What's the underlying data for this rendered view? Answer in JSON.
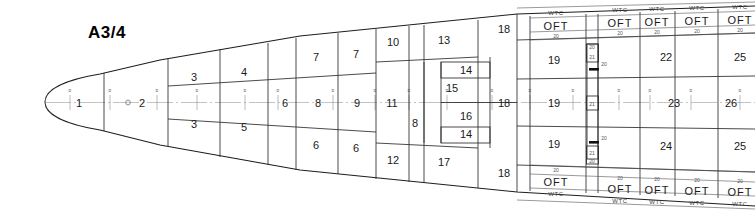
{
  "drawing": {
    "title": "A3/4",
    "type": "ship-general-arrangement-tank-plan",
    "view": "plan-view-deck-layout",
    "canvas": {
      "width": 755,
      "height": 213
    },
    "background_color": "#ffffff",
    "line_color": "#1d1d1d",
    "centerline_color": "#9a9a9a"
  },
  "labels": {
    "oft": "OFT",
    "wtc": "WTC",
    "dim_20": "20",
    "dim_21": "21"
  },
  "centerline_compartments": [
    {
      "id": "cl-1",
      "label": "1",
      "x": 73,
      "y": 102
    },
    {
      "id": "cl-2",
      "label": "2",
      "x": 140,
      "y": 102
    },
    {
      "id": "cl-6",
      "label": "6",
      "x": 285,
      "y": 102
    },
    {
      "id": "cl-8",
      "label": "8",
      "x": 318,
      "y": 102
    },
    {
      "id": "cl-9",
      "label": "9",
      "x": 360,
      "y": 102
    },
    {
      "id": "cl-11",
      "label": "11",
      "x": 392,
      "y": 102
    },
    {
      "id": "cl-18",
      "label": "18",
      "x": 504,
      "y": 102
    },
    {
      "id": "cl-19",
      "label": "19",
      "x": 552,
      "y": 102
    },
    {
      "id": "cl-23",
      "label": "23",
      "x": 672,
      "y": 102
    },
    {
      "id": "cl-26",
      "label": "26",
      "x": 733,
      "y": 102
    }
  ],
  "upper_compartments": [
    {
      "id": "up-3",
      "label": "3",
      "x": 194,
      "y": 77
    },
    {
      "id": "up-4",
      "label": "4",
      "x": 244,
      "y": 72
    },
    {
      "id": "up-7a",
      "label": "7",
      "x": 316,
      "y": 57
    },
    {
      "id": "up-7b",
      "label": "7",
      "x": 354,
      "y": 55
    },
    {
      "id": "up-10",
      "label": "10",
      "x": 393,
      "y": 43
    },
    {
      "id": "up-13",
      "label": "13",
      "x": 443,
      "y": 41
    },
    {
      "id": "up-14",
      "label": "14",
      "x": 437,
      "y": 70
    },
    {
      "id": "up-15",
      "label": "15",
      "x": 447,
      "y": 88
    },
    {
      "id": "up-18",
      "label": "18",
      "x": 504,
      "y": 30
    },
    {
      "id": "up-19",
      "label": "19",
      "x": 552,
      "y": 60
    },
    {
      "id": "up-22",
      "label": "22",
      "x": 666,
      "y": 57
    },
    {
      "id": "up-25",
      "label": "25",
      "x": 740,
      "y": 57
    }
  ],
  "lower_compartments": [
    {
      "id": "lo-3",
      "label": "3",
      "x": 194,
      "y": 124
    },
    {
      "id": "lo-5",
      "label": "5",
      "x": 244,
      "y": 127
    },
    {
      "id": "lo-6a",
      "label": "6",
      "x": 316,
      "y": 145
    },
    {
      "id": "lo-6b",
      "label": "6",
      "x": 354,
      "y": 148
    },
    {
      "id": "lo-8",
      "label": "8",
      "x": 414,
      "y": 123
    },
    {
      "id": "lo-16",
      "label": "16",
      "x": 449,
      "y": 117
    },
    {
      "id": "lo-14",
      "label": "14",
      "x": 437,
      "y": 134
    },
    {
      "id": "lo-12",
      "label": "12",
      "x": 393,
      "y": 160
    },
    {
      "id": "lo-17",
      "label": "17",
      "x": 443,
      "y": 162
    },
    {
      "id": "lo-18",
      "label": "18",
      "x": 504,
      "y": 173
    },
    {
      "id": "lo-19",
      "label": "19",
      "x": 552,
      "y": 144
    },
    {
      "id": "lo-24",
      "label": "24",
      "x": 666,
      "y": 146
    },
    {
      "id": "lo-25",
      "label": "25",
      "x": 740,
      "y": 146
    }
  ],
  "tank_strips_top": [
    {
      "id": "t-top-1",
      "x": 555,
      "wtc_y": 12,
      "oft_y": 26,
      "dim_y": 38,
      "dim": "20"
    },
    {
      "id": "t-top-2",
      "x": 620,
      "wtc_y": 9,
      "oft_y": 23,
      "dim_y": 33,
      "dim": "20"
    },
    {
      "id": "t-top-3",
      "x": 655,
      "wtc_y": 8,
      "oft_y": 21,
      "dim_y": 31,
      "dim": "20"
    },
    {
      "id": "t-top-4",
      "x": 700,
      "wtc_y": 7,
      "oft_y": 20,
      "dim_y": 30,
      "dim": "20"
    },
    {
      "id": "t-top-5",
      "x": 742,
      "wtc_y": 6,
      "oft_y": 19,
      "dim_y": 29,
      "dim": "20"
    }
  ],
  "tank_strips_bottom": [
    {
      "id": "t-bot-1",
      "x": 555,
      "dim_y": 167,
      "oft_y": 182,
      "wtc_y": 196,
      "dim": "20"
    },
    {
      "id": "t-bot-2",
      "x": 620,
      "dim_y": 175,
      "oft_y": 189,
      "wtc_y": 201,
      "dim": "20"
    },
    {
      "id": "t-bot-3",
      "x": 655,
      "dim_y": 177,
      "oft_y": 190,
      "wtc_y": 202,
      "dim": "20"
    },
    {
      "id": "t-bot-4",
      "x": 700,
      "dim_y": 178,
      "oft_y": 191,
      "wtc_y": 203,
      "dim": "20"
    },
    {
      "id": "t-bot-5",
      "x": 742,
      "dim_y": 179,
      "oft_y": 192,
      "wtc_y": 204,
      "dim": "20"
    }
  ],
  "center_duct": {
    "x": 592,
    "labels": [
      {
        "id": "duct-20-top",
        "label": "20",
        "y": 47
      },
      {
        "id": "duct-21-top",
        "label": "21",
        "y": 57
      },
      {
        "id": "duct-21-mid",
        "label": "21",
        "y": 103
      },
      {
        "id": "duct-21-bot",
        "label": "21",
        "y": 152
      },
      {
        "id": "duct-20-bot",
        "label": "20",
        "y": 162
      }
    ],
    "arrow_labels": [
      {
        "id": "duct-arrow-upper",
        "label": "20",
        "x": 604,
        "y": 69
      },
      {
        "id": "duct-arrow-lower",
        "label": "20",
        "x": 604,
        "y": 143
      }
    ]
  },
  "frame_ticks": [
    {
      "x": 70,
      "label": ""
    },
    {
      "x": 110,
      "label": ""
    },
    {
      "x": 157,
      "label": ""
    },
    {
      "x": 197,
      "label": ""
    },
    {
      "x": 245,
      "label": ""
    },
    {
      "x": 278,
      "label": ""
    },
    {
      "x": 303,
      "label": ""
    },
    {
      "x": 333,
      "label": ""
    },
    {
      "x": 375,
      "label": ""
    },
    {
      "x": 409,
      "label": ""
    },
    {
      "x": 447,
      "label": ""
    },
    {
      "x": 492,
      "label": ""
    },
    {
      "x": 530,
      "label": ""
    },
    {
      "x": 573,
      "label": ""
    },
    {
      "x": 619,
      "label": ""
    },
    {
      "x": 650,
      "label": ""
    },
    {
      "x": 691,
      "label": ""
    },
    {
      "x": 740,
      "label": ""
    }
  ]
}
